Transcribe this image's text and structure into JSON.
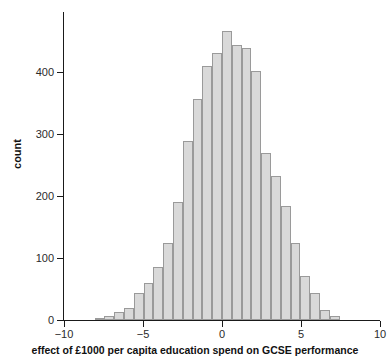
{
  "chart_data": {
    "type": "bar",
    "subtype": "histogram",
    "title": "",
    "subtitle": "",
    "xlabel": "effect of £1000 per capita education spend on GCSE performance",
    "ylabel": "count",
    "xlim": [
      -10,
      10
    ],
    "ylim": [
      0,
      480
    ],
    "grid": false,
    "legend": null,
    "bin_width": 0.62,
    "bar_fill": "#d9d9d9",
    "bar_stroke": "#9a9a9a",
    "axis_color": "#1a1a1a",
    "xticks": [
      {
        "value": -10,
        "label": "−10"
      },
      {
        "value": -5,
        "label": "−5"
      },
      {
        "value": 0,
        "label": "0"
      },
      {
        "value": 5,
        "label": "5"
      },
      {
        "value": 10,
        "label": "10"
      }
    ],
    "yticks": [
      {
        "value": 0,
        "label": "0"
      },
      {
        "value": 100,
        "label": "100"
      },
      {
        "value": 200,
        "label": "200"
      },
      {
        "value": 300,
        "label": "300"
      },
      {
        "value": 400,
        "label": "400"
      }
    ],
    "bins": [
      {
        "x_center": -7.75,
        "value": 2
      },
      {
        "x_center": -7.13,
        "value": 6
      },
      {
        "x_center": -6.51,
        "value": 13
      },
      {
        "x_center": -5.89,
        "value": 20
      },
      {
        "x_center": -5.27,
        "value": 44
      },
      {
        "x_center": -4.65,
        "value": 60
      },
      {
        "x_center": -4.03,
        "value": 86
      },
      {
        "x_center": -3.41,
        "value": 125
      },
      {
        "x_center": -2.79,
        "value": 190
      },
      {
        "x_center": -2.17,
        "value": 289
      },
      {
        "x_center": -1.55,
        "value": 356
      },
      {
        "x_center": -0.93,
        "value": 410
      },
      {
        "x_center": -0.31,
        "value": 430
      },
      {
        "x_center": 0.31,
        "value": 466
      },
      {
        "x_center": 0.93,
        "value": 444
      },
      {
        "x_center": 1.55,
        "value": 438
      },
      {
        "x_center": 2.17,
        "value": 402
      },
      {
        "x_center": 2.79,
        "value": 269
      },
      {
        "x_center": 3.41,
        "value": 232
      },
      {
        "x_center": 4.03,
        "value": 184
      },
      {
        "x_center": 4.65,
        "value": 124
      },
      {
        "x_center": 5.27,
        "value": 71
      },
      {
        "x_center": 5.89,
        "value": 43
      },
      {
        "x_center": 6.51,
        "value": 16
      },
      {
        "x_center": 7.13,
        "value": 7
      }
    ]
  }
}
